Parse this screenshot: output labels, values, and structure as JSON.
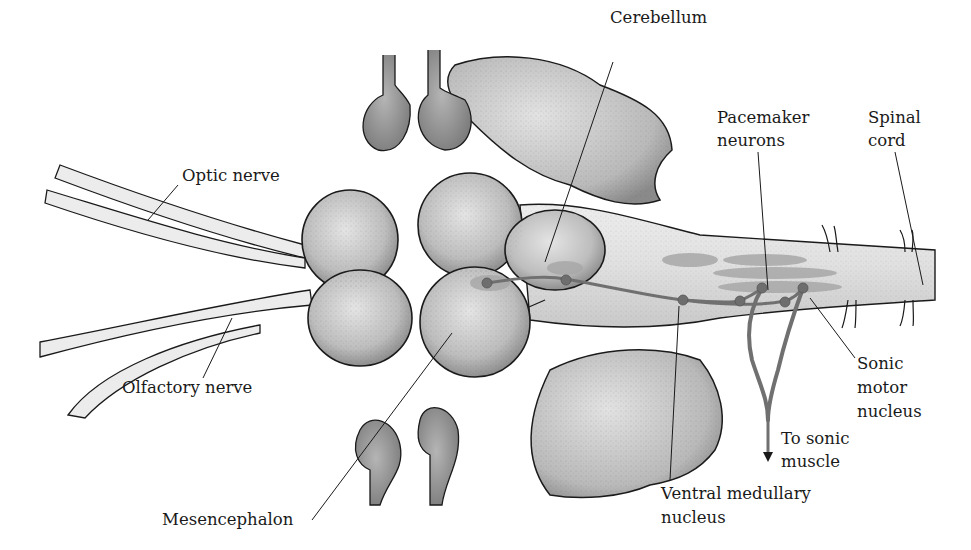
{
  "figure": {
    "colors": {
      "tissue_light": "#e6e6e6",
      "tissue_mid": "#c8c8c8",
      "tissue_dark": "#9a9a9a",
      "outline": "#1a1a1a",
      "pathway": "#7a7a7a",
      "nucleus_oval": "#a8a8a8",
      "neuron_dot": "#6e6e6e"
    }
  },
  "labels": {
    "cerebellum": "Cerebellum",
    "pacemaker_1": "Pacemaker",
    "pacemaker_2": "neurons",
    "spinal_1": "Spinal",
    "spinal_2": "cord",
    "optic": "Optic nerve",
    "olfactory": "Olfactory nerve",
    "sonic_motor_1": "Sonic",
    "sonic_motor_2": "motor",
    "sonic_motor_3": "nucleus",
    "to_muscle_1": "To sonic",
    "to_muscle_2": "muscle",
    "ventral_1": "Ventral medullary",
    "ventral_2": "nucleus",
    "mesencephalon": "Mesencephalon"
  }
}
